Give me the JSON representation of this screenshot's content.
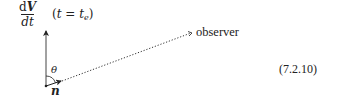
{
  "diagram": {
    "vector_label": {
      "numerator_d": "d",
      "numerator_var": "V",
      "denominator": "dt",
      "condition_open": "(",
      "condition_var": "t",
      "condition_eq": " = ",
      "condition_rhs": "t",
      "condition_sub": "e",
      "condition_close": ")"
    },
    "angle_label": "θ",
    "normal_label": "n",
    "observer_label": "observer",
    "equation_number": "(7.2.10)",
    "colors": {
      "ink": "#222222",
      "background": "#ffffff"
    },
    "geometry": {
      "origin": [
        46,
        86
      ],
      "dVdt_arrow_tip": [
        46,
        30
      ],
      "normal_arrow_tip": [
        61,
        81
      ],
      "observer_line_end": [
        192,
        33
      ]
    }
  }
}
